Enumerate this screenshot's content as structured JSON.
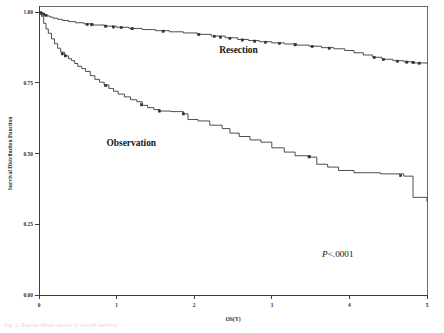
{
  "figure": {
    "caption_fragment": "Fig. 2. Kaplan-Meier curves of overall survival"
  },
  "chart_data": {
    "type": "line",
    "title": "",
    "subtitle": "",
    "xlabel": "OS(Y)",
    "ylabel": "Survival Distribution Function",
    "xlim": [
      0,
      5
    ],
    "ylim": [
      0.0,
      1.0
    ],
    "xticks": [
      0,
      1,
      2,
      3,
      4,
      5
    ],
    "xticklabels": [
      "0",
      "1",
      "2",
      "3",
      "4",
      "5"
    ],
    "yticks": [
      0.0,
      0.25,
      0.5,
      0.75,
      1.0
    ],
    "yticklabels": [
      "0.00",
      "0.25",
      "0.50",
      "0.75",
      "1.00"
    ],
    "grid": false,
    "legend_position": "inline-annotations",
    "annotations": [
      {
        "name": "resection-label",
        "text": "Resection",
        "x": 2.57,
        "y": 0.855
      },
      {
        "name": "observation-label",
        "text": "Observation",
        "x": 1.19,
        "y": 0.525
      },
      {
        "name": "pvalue-label",
        "text": "P<.0001",
        "x": 3.85,
        "y": 0.135
      }
    ],
    "pvalue": "P<.0001",
    "series": [
      {
        "name": "Resection",
        "step": "post",
        "points": [
          [
            0.0,
            1.0
          ],
          [
            0.04,
            0.995
          ],
          [
            0.07,
            0.99
          ],
          [
            0.1,
            0.986
          ],
          [
            0.14,
            0.982
          ],
          [
            0.18,
            0.978
          ],
          [
            0.24,
            0.974
          ],
          [
            0.3,
            0.97
          ],
          [
            0.38,
            0.966
          ],
          [
            0.47,
            0.962
          ],
          [
            0.58,
            0.958
          ],
          [
            0.7,
            0.954
          ],
          [
            0.84,
            0.95
          ],
          [
            1.0,
            0.946
          ],
          [
            1.16,
            0.942
          ],
          [
            1.33,
            0.938
          ],
          [
            1.5,
            0.934
          ],
          [
            1.68,
            0.93
          ],
          [
            1.86,
            0.926
          ],
          [
            2.04,
            0.921
          ],
          [
            2.22,
            0.915
          ],
          [
            2.4,
            0.909
          ],
          [
            2.56,
            0.903
          ],
          [
            2.7,
            0.899
          ],
          [
            2.84,
            0.895
          ],
          [
            3.0,
            0.891
          ],
          [
            3.16,
            0.887
          ],
          [
            3.32,
            0.883
          ],
          [
            3.48,
            0.879
          ],
          [
            3.64,
            0.874
          ],
          [
            3.8,
            0.87
          ],
          [
            3.94,
            0.864
          ],
          [
            4.06,
            0.856
          ],
          [
            4.18,
            0.848
          ],
          [
            4.3,
            0.84
          ],
          [
            4.42,
            0.833
          ],
          [
            4.56,
            0.828
          ],
          [
            4.7,
            0.824
          ],
          [
            4.84,
            0.82
          ],
          [
            5.0,
            0.818
          ]
        ],
        "censored": [
          [
            0.03,
            0.996
          ],
          [
            0.06,
            0.992
          ],
          [
            0.09,
            0.988
          ],
          [
            0.62,
            0.956
          ],
          [
            0.68,
            0.955
          ],
          [
            0.86,
            0.95
          ],
          [
            0.96,
            0.947
          ],
          [
            1.06,
            0.945
          ],
          [
            1.2,
            0.941
          ],
          [
            1.6,
            0.932
          ],
          [
            2.06,
            0.92
          ],
          [
            2.26,
            0.914
          ],
          [
            2.34,
            0.911
          ],
          [
            2.46,
            0.907
          ],
          [
            2.62,
            0.901
          ],
          [
            2.78,
            0.897
          ],
          [
            2.92,
            0.893
          ],
          [
            3.1,
            0.889
          ],
          [
            3.3,
            0.884
          ],
          [
            3.52,
            0.878
          ],
          [
            3.74,
            0.872
          ],
          [
            4.32,
            0.839
          ],
          [
            4.44,
            0.832
          ],
          [
            4.62,
            0.826
          ],
          [
            4.74,
            0.823
          ],
          [
            4.82,
            0.821
          ],
          [
            4.9,
            0.819
          ]
        ]
      },
      {
        "name": "Observation",
        "step": "post",
        "points": [
          [
            0.0,
            1.0
          ],
          [
            0.03,
            0.985
          ],
          [
            0.06,
            0.96
          ],
          [
            0.09,
            0.94
          ],
          [
            0.12,
            0.925
          ],
          [
            0.16,
            0.905
          ],
          [
            0.2,
            0.888
          ],
          [
            0.24,
            0.872
          ],
          [
            0.28,
            0.858
          ],
          [
            0.33,
            0.845
          ],
          [
            0.38,
            0.835
          ],
          [
            0.42,
            0.828
          ],
          [
            0.46,
            0.818
          ],
          [
            0.5,
            0.808
          ],
          [
            0.55,
            0.8
          ],
          [
            0.6,
            0.79
          ],
          [
            0.66,
            0.775
          ],
          [
            0.72,
            0.762
          ],
          [
            0.78,
            0.752
          ],
          [
            0.84,
            0.742
          ],
          [
            0.9,
            0.73
          ],
          [
            0.96,
            0.72
          ],
          [
            1.02,
            0.71
          ],
          [
            1.1,
            0.7
          ],
          [
            1.18,
            0.69
          ],
          [
            1.26,
            0.683
          ],
          [
            1.33,
            0.67
          ],
          [
            1.4,
            0.662
          ],
          [
            1.48,
            0.655
          ],
          [
            1.56,
            0.65
          ],
          [
            1.7,
            0.648
          ],
          [
            1.86,
            0.64
          ],
          [
            1.92,
            0.62
          ],
          [
            2.05,
            0.615
          ],
          [
            2.2,
            0.6
          ],
          [
            2.36,
            0.588
          ],
          [
            2.46,
            0.572
          ],
          [
            2.58,
            0.56
          ],
          [
            2.72,
            0.548
          ],
          [
            2.86,
            0.54
          ],
          [
            3.0,
            0.52
          ],
          [
            3.16,
            0.505
          ],
          [
            3.3,
            0.492
          ],
          [
            3.5,
            0.487
          ],
          [
            3.58,
            0.462
          ],
          [
            3.72,
            0.452
          ],
          [
            3.86,
            0.44
          ],
          [
            4.06,
            0.432
          ],
          [
            4.4,
            0.428
          ],
          [
            4.7,
            0.42
          ],
          [
            4.82,
            0.345
          ],
          [
            5.0,
            0.33
          ]
        ],
        "censored": [
          [
            0.3,
            0.852
          ],
          [
            0.34,
            0.845
          ],
          [
            0.86,
            0.74
          ],
          [
            1.32,
            0.672
          ],
          [
            1.55,
            0.65
          ],
          [
            1.86,
            0.64
          ],
          [
            3.48,
            0.488
          ],
          [
            4.66,
            0.422
          ]
        ]
      }
    ]
  }
}
